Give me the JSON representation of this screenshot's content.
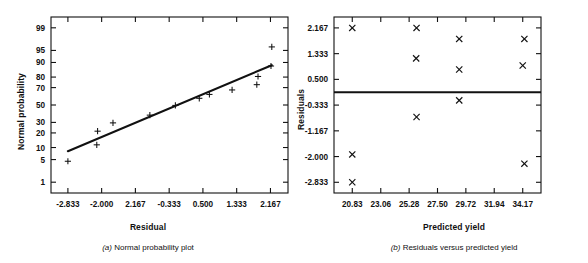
{
  "figure": {
    "panels": [
      {
        "id": "a",
        "caption_prefix": "(a)",
        "caption": "Normal probability plot"
      },
      {
        "id": "b",
        "caption_prefix": "(b)",
        "caption": "Residuals versus predicted yield"
      }
    ]
  },
  "chart_data": [
    {
      "type": "scatter",
      "title": "(a) Normal probability plot",
      "xlabel": "Residual",
      "ylabel": "Normal probability",
      "marker": "plus",
      "grid": false,
      "legend": null,
      "xticklabels": [
        "-2.833",
        "-2.000",
        "2.167",
        "-0.333",
        "0.500",
        "1.333",
        "2.167"
      ],
      "xtickvalues": [
        -2.833,
        -2.0,
        -1.167,
        -0.333,
        0.5,
        1.333,
        2.167
      ],
      "xlim": [
        -3.25,
        2.6
      ],
      "yticklabels": [
        "1",
        "5",
        "10",
        "20",
        "30",
        "50",
        "70",
        "80",
        "90",
        "95",
        "99"
      ],
      "ytickvalues": [
        1,
        5,
        10,
        20,
        30,
        50,
        70,
        80,
        90,
        95,
        99
      ],
      "ylim": [
        0.4,
        99.6
      ],
      "yscale": "normal-probability",
      "points": [
        {
          "x": -2.833,
          "y": 4.5
        },
        {
          "x": -2.12,
          "y": 11.5
        },
        {
          "x": -2.1,
          "y": 21.5
        },
        {
          "x": -1.72,
          "y": 29.5
        },
        {
          "x": -0.81,
          "y": 38.0
        },
        {
          "x": -0.18,
          "y": 49.5
        },
        {
          "x": 0.41,
          "y": 58.0
        },
        {
          "x": 0.66,
          "y": 62.5
        },
        {
          "x": 1.22,
          "y": 67.5
        },
        {
          "x": 1.83,
          "y": 73.0
        },
        {
          "x": 1.86,
          "y": 80.5
        },
        {
          "x": 2.18,
          "y": 88.0
        },
        {
          "x": 2.2,
          "y": 96.0
        }
      ],
      "fit_line": {
        "x0": -2.833,
        "y0": 8.2,
        "x1": 2.2,
        "y1": 88.5
      }
    },
    {
      "type": "scatter",
      "title": "(b) Residuals versus predicted yield",
      "xlabel": "Predicted yield",
      "ylabel": "Residuals",
      "marker": "cross",
      "grid": false,
      "legend": null,
      "xticklabels": [
        "20.83",
        "23.06",
        "25.28",
        "27.50",
        "29.72",
        "31.94",
        "34.17"
      ],
      "xtickvalues": [
        20.83,
        23.06,
        25.28,
        27.5,
        29.72,
        31.94,
        34.17
      ],
      "xlim": [
        19.4,
        35.6
      ],
      "yticklabels": [
        "2.167",
        "1.333",
        "0.500",
        "-0.333",
        "-1.167",
        "-2.000",
        "-2.833"
      ],
      "ytickvalues": [
        2.167,
        1.333,
        0.5,
        -0.333,
        -1.167,
        -2.0,
        -2.833
      ],
      "ylim": [
        -3.18,
        2.52
      ],
      "zero_line": 0.083,
      "points": [
        {
          "x": 20.83,
          "y": 2.167
        },
        {
          "x": 20.83,
          "y": -1.93
        },
        {
          "x": 20.83,
          "y": -2.833
        },
        {
          "x": 25.86,
          "y": 2.167
        },
        {
          "x": 25.83,
          "y": 1.18
        },
        {
          "x": 25.86,
          "y": -0.72
        },
        {
          "x": 29.2,
          "y": 1.81
        },
        {
          "x": 29.2,
          "y": 0.82
        },
        {
          "x": 29.2,
          "y": -0.18
        },
        {
          "x": 34.3,
          "y": 1.81
        },
        {
          "x": 34.17,
          "y": 0.95
        },
        {
          "x": 34.3,
          "y": -2.23
        }
      ]
    }
  ]
}
